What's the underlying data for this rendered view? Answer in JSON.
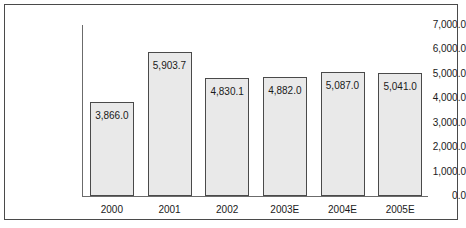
{
  "chart_data": {
    "type": "bar",
    "title": "",
    "xlabel": "",
    "ylabel": "",
    "categories": [
      "2000",
      "2001",
      "2002",
      "2003E",
      "2004E",
      "2005E"
    ],
    "values": [
      3866.0,
      5903.7,
      4830.1,
      4882.0,
      5087.0,
      5041.0
    ],
    "data_labels": [
      "3,866.0",
      "5,903.7",
      "4,830.1",
      "4,882.0",
      "5,087.0",
      "5,041.0"
    ],
    "ylim": [
      0,
      7000
    ],
    "ytick_values": [
      7000,
      6000,
      5000,
      4000,
      3000,
      2000,
      1000,
      0
    ],
    "ytick_labels": [
      "7,000.0",
      "6,000.0",
      "5,000.0",
      "4,000.0",
      "3,000.0",
      "2,000.0",
      "1,000.0",
      "0.0"
    ],
    "grid": false,
    "legend": null,
    "bar_fill_color": "#e9e9e9",
    "bar_border_color": "#4a4a4a",
    "axis_color": "#6b6b6b",
    "frame_color": "#4a4a4a",
    "background_color": "#ffffff"
  }
}
